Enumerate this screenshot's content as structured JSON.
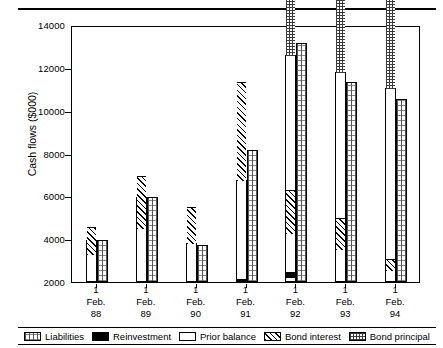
{
  "chart_data": {
    "type": "bar",
    "title": "",
    "subtitle": "",
    "xlabel": "",
    "ylabel": "Cash flows ($000)",
    "ylim": [
      2000,
      14000
    ],
    "yticks": [
      2000,
      4000,
      6000,
      8000,
      10000,
      12000,
      14000
    ],
    "grid": false,
    "legend_position": "bottom",
    "categories": [
      "1 Feb. 88",
      "1 Feb. 89",
      "1 Feb. 90",
      "1 Feb. 91",
      "1 Feb. 92",
      "1 Feb. 93",
      "1 Feb. 94"
    ],
    "category_lines": [
      [
        "1",
        "Feb.",
        "88"
      ],
      [
        "1",
        "Feb.",
        "89"
      ],
      [
        "1",
        "Feb.",
        "90"
      ],
      [
        "1",
        "Feb.",
        "91"
      ],
      [
        "1",
        "Feb.",
        "92"
      ],
      [
        "1",
        "Feb.",
        "93"
      ],
      [
        "1",
        "Feb.",
        "94"
      ]
    ],
    "series": [
      {
        "name": "Prior balance",
        "stack": "assets",
        "values": [
          2500,
          3450,
          2000,
          2000,
          2000,
          2000,
          2000
        ]
      },
      {
        "name": "Bond principal",
        "stack": "assets",
        "values": [
          2650,
          2000,
          2000,
          2000,
          10300,
          10250,
          10500
        ]
      },
      {
        "name": "Bond interest",
        "stack": "assets",
        "values": [
          3950,
          5950,
          3750,
          6650,
          12350,
          11750,
          11050
        ]
      },
      {
        "name": "Reinvestment",
        "stack": "assets",
        "values": [
          3950,
          5950,
          3800,
          6750,
          12600,
          11800,
          11050
        ]
      },
      {
        "name": "Liabilities",
        "stack": "liabilities",
        "values": [
          3950,
          5950,
          3750,
          3700,
          13050,
          11350,
          10550
        ]
      }
    ],
    "stacked_bar_tops": {
      "1 Feb. 88": {
        "prior_balance": 2500,
        "bond_principal": 2650,
        "bond_interest": 3950,
        "reinvestment": 3950
      },
      "1 Feb. 89": {
        "prior_balance": 3450,
        "bond_principal": 3450,
        "bond_interest": 5950,
        "reinvestment": 5950
      },
      "1 Feb. 90": {
        "prior_balance": 2000,
        "bond_principal": 2000,
        "bond_interest": 3750,
        "reinvestment": 3800
      },
      "1 Feb. 91": {
        "prior_balance": 2000,
        "bond_principal": 2000,
        "bond_interest": 6650,
        "reinvestment": 6750
      },
      "1 Feb. 92": {
        "prior_balance": 2000,
        "bond_principal": 10300,
        "bond_interest": 12350,
        "reinvestment": 12600
      },
      "1 Feb. 93": {
        "prior_balance": 2000,
        "bond_principal": 10250,
        "bond_interest": 11750,
        "reinvestment": 11800
      },
      "1 Feb. 94": {
        "prior_balance": 2000,
        "bond_principal": 10500,
        "bond_interest": 11050,
        "reinvestment": 11050
      }
    },
    "liabilities_values": [
      3950,
      5950,
      3750,
      8150,
      13150,
      11350,
      10550
    ]
  },
  "legend": {
    "items": [
      {
        "label": "Liabilities",
        "pattern": "stipple"
      },
      {
        "label": "Reinvestment",
        "pattern": "solid-black"
      },
      {
        "label": "Prior balance",
        "pattern": "white"
      },
      {
        "label": "Bond interest",
        "pattern": "diagonal-hatch"
      },
      {
        "label": "Bond principal",
        "pattern": "cross-hatch"
      }
    ]
  },
  "axis": {
    "y_label": "Cash flows ($000)",
    "y_ticks": [
      "14000",
      "12000",
      "10000",
      "8000",
      "6000",
      "4000",
      "2000"
    ]
  },
  "colors": {
    "ink": "#000000",
    "background": "#ffffff",
    "hatch": "#3b3b3b",
    "stipple": "#555555"
  }
}
